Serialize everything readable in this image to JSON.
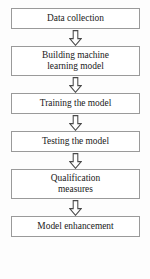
{
  "diagram": {
    "type": "flowchart",
    "orientation": "vertical",
    "colors": {
      "background": "#fdfdfd",
      "box_fill": "#ffffff",
      "box_border": "#9a9a9a",
      "text": "#1a1a1a",
      "arrow_stroke": "#4a4a4a",
      "arrow_fill": "#ffffff"
    },
    "nodes": [
      {
        "id": "data-collection",
        "lines": [
          "Data collection"
        ]
      },
      {
        "id": "building-model",
        "lines": [
          "Building machine",
          "learning model"
        ]
      },
      {
        "id": "training",
        "lines": [
          "Training the model"
        ]
      },
      {
        "id": "testing",
        "lines": [
          "Testing the model"
        ]
      },
      {
        "id": "qualification",
        "lines": [
          "Qualification",
          "measures"
        ]
      },
      {
        "id": "enhancement",
        "lines": [
          "Model enhancement"
        ]
      }
    ],
    "connectors": [
      {
        "id": "arrow-1",
        "icon": "hollow-down-arrow-icon",
        "from": "data-collection",
        "to": "building-model"
      },
      {
        "id": "arrow-2",
        "icon": "hollow-down-arrow-icon",
        "from": "building-model",
        "to": "training"
      },
      {
        "id": "arrow-3",
        "icon": "hollow-down-arrow-icon",
        "from": "training",
        "to": "testing"
      },
      {
        "id": "arrow-4",
        "icon": "hollow-down-arrow-icon",
        "from": "testing",
        "to": "qualification"
      },
      {
        "id": "arrow-5",
        "icon": "hollow-down-arrow-icon",
        "from": "qualification",
        "to": "enhancement"
      }
    ]
  }
}
